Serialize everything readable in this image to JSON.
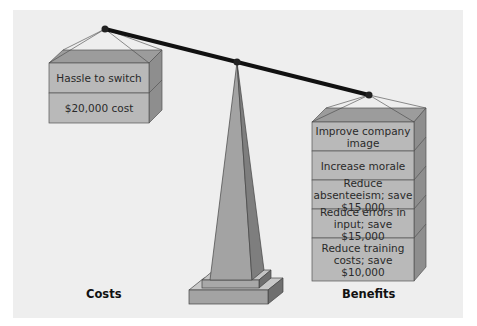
{
  "diagram": {
    "type": "balance-scale",
    "colors": {
      "panel_bg": "#eeeeee",
      "box_front": "#b9b9b9",
      "box_top": "#9c9c9c",
      "box_side": "#8e8e8e",
      "beam": "#111111",
      "obelisk_front": "#a3a3a3",
      "obelisk_side": "#7e7e7e"
    },
    "costs": {
      "caption": "Costs",
      "items": [
        {
          "label": "Hassle to switch"
        },
        {
          "label": "$20,000 cost"
        }
      ]
    },
    "benefits": {
      "caption": "Benefits",
      "items": [
        {
          "label": "Improve company image"
        },
        {
          "label": "Increase morale"
        },
        {
          "label": "Reduce absenteeism; save $15,000"
        },
        {
          "label": "Reduce errors in input; save $15,000"
        },
        {
          "label": "Reduce training costs; save $10,000"
        }
      ]
    }
  }
}
